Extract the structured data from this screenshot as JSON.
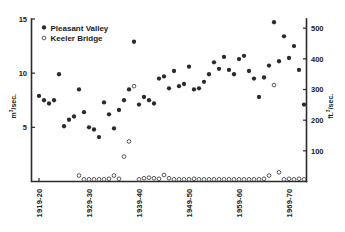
{
  "chart_data": {
    "type": "scatter",
    "title": "",
    "xlabel": "",
    "ylabel": "m3/sec.",
    "ylabel_secondary": "ft.3/sec.",
    "grid": false,
    "legend_position": "top-left",
    "xlim": [
      1918.0,
      1973.0
    ],
    "ylim": [
      0,
      15
    ],
    "ylim_secondary": [
      0,
      530
    ],
    "y_ticks": [
      5,
      10,
      15
    ],
    "y_ticks_secondary": [
      100,
      200,
      300,
      400,
      500
    ],
    "x_ticks": [
      1919.5,
      1929.5,
      1939.5,
      1949.5,
      1959.5,
      1969.5
    ],
    "x_tick_labels": [
      "1919-20",
      "1929-30",
      "1939-40",
      "1949-50",
      "1959-60",
      "1969-70"
    ],
    "series": [
      {
        "name": "Pleasant Valley",
        "marker": "filled-circle",
        "color": "#2a2a2a",
        "points": [
          [
            1919.5,
            7.9
          ],
          [
            1920.5,
            7.5
          ],
          [
            1921.5,
            7.2
          ],
          [
            1922.5,
            7.5
          ],
          [
            1923.5,
            9.9
          ],
          [
            1924.5,
            5.1
          ],
          [
            1925.5,
            5.7
          ],
          [
            1926.5,
            6.0
          ],
          [
            1927.5,
            8.5
          ],
          [
            1928.5,
            6.4
          ],
          [
            1929.5,
            5.0
          ],
          [
            1930.5,
            4.8
          ],
          [
            1931.5,
            4.1
          ],
          [
            1932.5,
            7.3
          ],
          [
            1933.5,
            6.2
          ],
          [
            1934.5,
            4.9
          ],
          [
            1935.5,
            6.6
          ],
          [
            1936.5,
            7.5
          ],
          [
            1937.5,
            8.5
          ],
          [
            1938.5,
            12.9
          ],
          [
            1939.5,
            7.1
          ],
          [
            1940.5,
            7.8
          ],
          [
            1941.5,
            7.5
          ],
          [
            1942.5,
            7.2
          ],
          [
            1943.5,
            9.5
          ],
          [
            1944.5,
            9.7
          ],
          [
            1945.5,
            8.6
          ],
          [
            1946.5,
            10.2
          ],
          [
            1947.5,
            8.8
          ],
          [
            1948.5,
            9.0
          ],
          [
            1949.5,
            10.6
          ],
          [
            1950.5,
            8.5
          ],
          [
            1951.5,
            8.6
          ],
          [
            1952.5,
            9.2
          ],
          [
            1953.5,
            9.9
          ],
          [
            1954.5,
            11.0
          ],
          [
            1955.5,
            10.4
          ],
          [
            1956.5,
            11.5
          ],
          [
            1957.5,
            10.3
          ],
          [
            1958.5,
            9.9
          ],
          [
            1959.5,
            11.3
          ],
          [
            1960.5,
            11.6
          ],
          [
            1961.5,
            10.2
          ],
          [
            1962.5,
            9.5
          ],
          [
            1963.5,
            7.8
          ],
          [
            1964.5,
            9.6
          ],
          [
            1965.5,
            10.7
          ],
          [
            1966.5,
            14.7
          ],
          [
            1967.5,
            11.1
          ],
          [
            1968.5,
            13.4
          ],
          [
            1969.5,
            11.4
          ],
          [
            1970.5,
            12.5
          ],
          [
            1971.5,
            10.3
          ],
          [
            1972.5,
            7.1
          ]
        ]
      },
      {
        "name": "Keeler Bridge",
        "marker": "open-circle",
        "color": "#3a3a3a",
        "points": [
          [
            1927.5,
            0.55
          ],
          [
            1928.5,
            0.2
          ],
          [
            1929.5,
            0.2
          ],
          [
            1930.5,
            0.2
          ],
          [
            1931.5,
            0.2
          ],
          [
            1932.5,
            0.2
          ],
          [
            1933.5,
            0.25
          ],
          [
            1934.5,
            0.55
          ],
          [
            1935.5,
            0.25
          ],
          [
            1936.5,
            2.3
          ],
          [
            1937.5,
            3.7
          ],
          [
            1938.5,
            8.8
          ],
          [
            1939.5,
            0.2
          ],
          [
            1940.5,
            0.3
          ],
          [
            1941.5,
            0.35
          ],
          [
            1942.5,
            0.3
          ],
          [
            1943.5,
            0.25
          ],
          [
            1944.5,
            0.6
          ],
          [
            1945.5,
            0.3
          ],
          [
            1946.5,
            0.2
          ],
          [
            1947.5,
            0.2
          ],
          [
            1948.5,
            0.2
          ],
          [
            1949.5,
            0.2
          ],
          [
            1950.5,
            0.25
          ],
          [
            1951.5,
            0.2
          ],
          [
            1952.5,
            0.2
          ],
          [
            1953.5,
            0.2
          ],
          [
            1954.5,
            0.2
          ],
          [
            1955.5,
            0.2
          ],
          [
            1956.5,
            0.2
          ],
          [
            1957.5,
            0.2
          ],
          [
            1958.5,
            0.2
          ],
          [
            1959.5,
            0.2
          ],
          [
            1960.5,
            0.2
          ],
          [
            1961.5,
            0.2
          ],
          [
            1962.5,
            0.2
          ],
          [
            1963.5,
            0.2
          ],
          [
            1964.5,
            0.25
          ],
          [
            1965.5,
            0.55
          ],
          [
            1966.5,
            8.9
          ],
          [
            1967.5,
            0.85
          ],
          [
            1968.5,
            0.2
          ],
          [
            1969.5,
            0.25
          ],
          [
            1970.5,
            0.2
          ],
          [
            1971.5,
            0.25
          ],
          [
            1972.5,
            0.2
          ]
        ]
      }
    ]
  },
  "legend": {
    "entries": [
      {
        "label": "Pleasant Valley",
        "marker": "filled-circle"
      },
      {
        "label": "Keeler Bridge",
        "marker": "open-circle"
      }
    ]
  },
  "axes": {
    "left_label_main": "m",
    "left_label_sup": "3",
    "left_label_rest": "/sec.",
    "right_label_main": "ft.",
    "right_label_sup": "3",
    "right_label_rest": "/sec."
  }
}
